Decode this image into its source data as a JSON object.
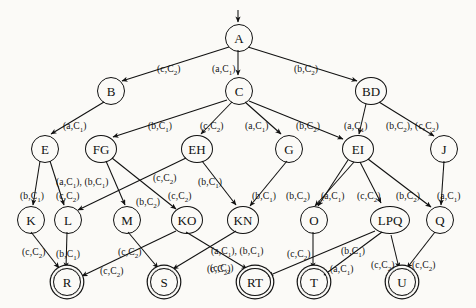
{
  "diagram": {
    "start_node": "A",
    "nodes": [
      {
        "id": "A",
        "label": "A",
        "x": 238,
        "y": 37,
        "r": 13,
        "accepting": false,
        "size": "n1"
      },
      {
        "id": "B",
        "label": "B",
        "x": 110,
        "y": 90,
        "r": 13,
        "accepting": false,
        "size": "n1"
      },
      {
        "id": "C",
        "label": "C",
        "x": 238,
        "y": 90,
        "r": 13,
        "accepting": false,
        "size": "n1"
      },
      {
        "id": "BD",
        "label": "BD",
        "x": 370,
        "y": 90,
        "r": 15,
        "accepting": false,
        "size": "n2"
      },
      {
        "id": "E",
        "label": "E",
        "x": 44,
        "y": 148,
        "r": 13,
        "accepting": false,
        "size": "n1"
      },
      {
        "id": "FG",
        "label": "FG",
        "x": 100,
        "y": 148,
        "r": 15,
        "accepting": false,
        "size": "n2"
      },
      {
        "id": "EH",
        "label": "EH",
        "x": 196,
        "y": 148,
        "r": 15,
        "accepting": false,
        "size": "n2"
      },
      {
        "id": "G",
        "label": "G",
        "x": 288,
        "y": 148,
        "r": 13,
        "accepting": false,
        "size": "n1"
      },
      {
        "id": "EI",
        "label": "EI",
        "x": 357,
        "y": 148,
        "r": 15,
        "accepting": false,
        "size": "n2"
      },
      {
        "id": "J",
        "label": "J",
        "x": 443,
        "y": 148,
        "r": 13,
        "accepting": false,
        "size": "n1"
      },
      {
        "id": "K",
        "label": "K",
        "x": 30,
        "y": 219,
        "r": 13,
        "accepting": false,
        "size": "n1"
      },
      {
        "id": "L",
        "label": "L",
        "x": 67,
        "y": 219,
        "r": 13,
        "accepting": false,
        "size": "n1"
      },
      {
        "id": "M",
        "label": "M",
        "x": 126,
        "y": 219,
        "r": 13,
        "accepting": false,
        "size": "n1"
      },
      {
        "id": "KO",
        "label": "KO",
        "x": 186,
        "y": 219,
        "r": 15,
        "accepting": false,
        "size": "n2"
      },
      {
        "id": "KN",
        "label": "KN",
        "x": 242,
        "y": 219,
        "r": 15,
        "accepting": false,
        "size": "n2"
      },
      {
        "id": "O",
        "label": "O",
        "x": 313,
        "y": 219,
        "r": 13,
        "accepting": false,
        "size": "n1"
      },
      {
        "id": "LPQ",
        "label": "LPQ",
        "x": 389,
        "y": 219,
        "r": 19,
        "accepting": false,
        "size": "n3"
      },
      {
        "id": "Q",
        "label": "Q",
        "x": 439,
        "y": 219,
        "r": 13,
        "accepting": false,
        "size": "n1"
      },
      {
        "id": "R",
        "label": "R",
        "x": 66,
        "y": 281,
        "r": 13,
        "accepting": true,
        "size": "n1"
      },
      {
        "id": "S",
        "label": "S",
        "x": 163,
        "y": 281,
        "r": 13,
        "accepting": true,
        "size": "n1"
      },
      {
        "id": "RT",
        "label": "RT",
        "x": 254,
        "y": 281,
        "r": 15,
        "accepting": true,
        "size": "n2"
      },
      {
        "id": "T",
        "label": "T",
        "x": 313,
        "y": 281,
        "r": 13,
        "accepting": true,
        "size": "n1"
      },
      {
        "id": "U",
        "label": "U",
        "x": 401,
        "y": 281,
        "r": 13,
        "accepting": true,
        "size": "n1"
      }
    ],
    "edges": [
      {
        "from": "A",
        "to": "B",
        "label": "(c,C2)",
        "lx": 157,
        "ly": 63
      },
      {
        "from": "A",
        "to": "C",
        "label": "(a,C1)",
        "lx": 212,
        "ly": 63
      },
      {
        "from": "A",
        "to": "BD",
        "label": "(b,C2)",
        "lx": 294,
        "ly": 63
      },
      {
        "from": "B",
        "to": "E",
        "label": "(a,C1)",
        "lx": 63,
        "ly": 120
      },
      {
        "from": "C",
        "to": "FG",
        "label": "(b,C1)",
        "lx": 148,
        "ly": 120
      },
      {
        "from": "C",
        "to": "EH",
        "label": "(c,C2)",
        "lx": 200,
        "ly": 120
      },
      {
        "from": "C",
        "to": "G",
        "label": "(a,C1)",
        "lx": 245,
        "ly": 120
      },
      {
        "from": "C",
        "to": "EI",
        "label": "(b,C2)",
        "lx": 296,
        "ly": 120
      },
      {
        "from": "BD",
        "to": "EI",
        "label": "(a,C1)",
        "lx": 344,
        "ly": 120
      },
      {
        "from": "BD",
        "to": "J",
        "label": "(b,C2), (c,C2)",
        "lx": 386,
        "ly": 120
      },
      {
        "from": "E",
        "to": "K",
        "label": "(b,C1)",
        "lx": 20,
        "ly": 190
      },
      {
        "from": "E",
        "to": "L",
        "label": "(a,C1), (b,C1)",
        "lx": 56,
        "ly": 176
      },
      {
        "from": "E",
        "to": "L2",
        "label": "(c,C2)",
        "lx": 56,
        "ly": 190
      },
      {
        "from": "FG",
        "to": "M",
        "label": "(b,C2)",
        "lx": 136,
        "ly": 196
      },
      {
        "from": "FG",
        "to": "KO",
        "label": "(c,C2)",
        "lx": 168,
        "ly": 190
      },
      {
        "from": "EH",
        "to": "L",
        "label": "(c,C2)",
        "lx": 153,
        "ly": 172
      },
      {
        "from": "EH",
        "to": "KN",
        "label": "(b,C1)",
        "lx": 198,
        "ly": 176
      },
      {
        "from": "G",
        "to": "KN",
        "label": "(b,C1)",
        "lx": 252,
        "ly": 190
      },
      {
        "from": "EI",
        "to": "O",
        "label": "(b,C2)",
        "lx": 286,
        "ly": 190
      },
      {
        "from": "EI",
        "to": "O2",
        "label": "(a,C1)",
        "lx": 321,
        "ly": 190
      },
      {
        "from": "EI",
        "to": "LPQ",
        "label": "(c,C2)",
        "lx": 357,
        "ly": 190
      },
      {
        "from": "EI",
        "to": "Q",
        "label": "(b,C2)",
        "lx": 396,
        "ly": 190
      },
      {
        "from": "J",
        "to": "Q",
        "label": "(a,C1)",
        "lx": 437,
        "ly": 190
      },
      {
        "from": "K",
        "to": "R",
        "label": "(c,C2)",
        "lx": 22,
        "ly": 246
      },
      {
        "from": "L",
        "to": "R",
        "label": "(b,C1)",
        "lx": 56,
        "ly": 248
      },
      {
        "from": "M",
        "to": "S",
        "label": "(c,C2)",
        "lx": 118,
        "ly": 246
      },
      {
        "from": "KO",
        "to": "R",
        "label": "(c,C2)",
        "lx": 100,
        "ly": 265
      },
      {
        "from": "KN",
        "to": "S",
        "label": "(a,C1), (b,C1)",
        "lx": 211,
        "ly": 245
      },
      {
        "from": "KN",
        "to": "RT",
        "label": "(c,C2)",
        "lx": 207,
        "ly": 263
      },
      {
        "from": "KO",
        "to": "RT",
        "label": "(c,C2)",
        "lx": 210,
        "ly": 262
      },
      {
        "from": "O",
        "to": "T",
        "label": "(c,C2)",
        "lx": 287,
        "ly": 248
      },
      {
        "from": "LPQ",
        "to": "T",
        "label": "(b,C1)",
        "lx": 341,
        "ly": 245
      },
      {
        "from": "LPQ",
        "to": "T2",
        "label": "(a,C1)",
        "lx": 330,
        "ly": 263
      },
      {
        "from": "LPQ",
        "to": "U",
        "label": "(c,C2)",
        "lx": 371,
        "ly": 259
      },
      {
        "from": "Q",
        "to": "U",
        "label": "(c,C2)",
        "lx": 412,
        "ly": 259
      }
    ]
  }
}
